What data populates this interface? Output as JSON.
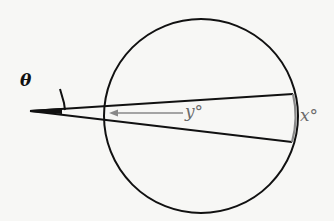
{
  "diagram": {
    "type": "geometry",
    "labels": {
      "theta": "θ",
      "y": "y°",
      "x": "x°"
    },
    "colors": {
      "stroke": "#111111",
      "annotation": "#777777",
      "background": "#f7f7f5"
    },
    "geometry": {
      "circle": {
        "cx": 201,
        "cy": 116,
        "r": 97
      },
      "vertex": {
        "x": 30,
        "y": 111
      },
      "secant_upper_end": {
        "x": 293,
        "y": 94
      },
      "secant_lower_end": {
        "x": 292,
        "y": 142
      }
    }
  }
}
